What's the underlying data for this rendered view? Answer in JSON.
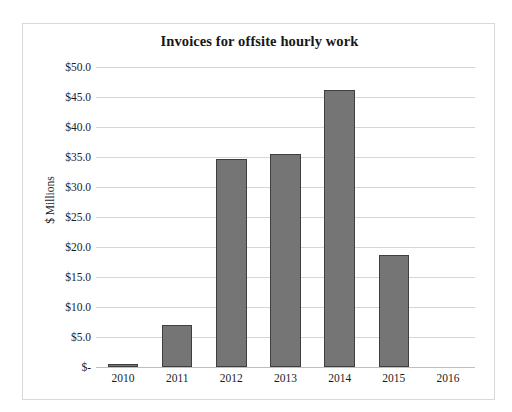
{
  "chart_data": {
    "type": "bar",
    "title": "Invoices for offsite hourly work",
    "xlabel": "",
    "ylabel": "$ Millions",
    "categories": [
      "2010",
      "2011",
      "2012",
      "2013",
      "2014",
      "2015",
      "2016"
    ],
    "values": [
      0.5,
      7.0,
      34.7,
      35.5,
      46.2,
      18.6,
      0
    ],
    "ylim": [
      0,
      50
    ],
    "ytick_values": [
      0,
      5,
      10,
      15,
      20,
      25,
      30,
      35,
      40,
      45,
      50
    ],
    "ytick_labels": [
      "$-",
      "$5.0",
      "$10.0",
      "$15.0",
      "$20.0",
      "$25.0",
      "$30.0",
      "$35.0",
      "$40.0",
      "$45.0",
      "$50.0"
    ],
    "grid": true,
    "legend": false,
    "bar_color": "#757575",
    "bar_border_color": "#3f3f3f",
    "gridline_color": "#d6d6d6",
    "frame_border_color": "#d9d9d9",
    "background_color": "#ffffff"
  }
}
